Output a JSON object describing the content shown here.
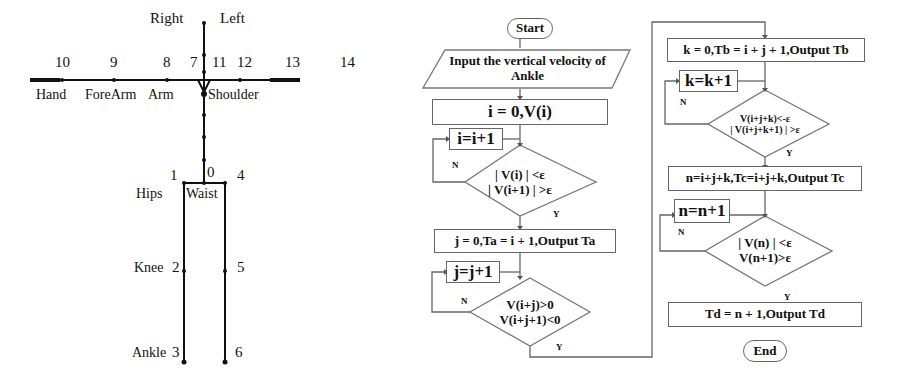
{
  "skeleton": {
    "direction_labels": {
      "right": "Right",
      "left": "Left"
    },
    "joint_numbers": {
      "j0": "0",
      "j1": "1",
      "j2": "2",
      "j3": "3",
      "j4": "4",
      "j5": "5",
      "j6": "6",
      "j7": "7",
      "j8": "8",
      "j9": "9",
      "j10": "10",
      "j11": "11",
      "j12": "12",
      "j13": "13",
      "j14": "14"
    },
    "part_labels": {
      "hand": "Hand",
      "forearm": "ForeArm",
      "arm": "Arm",
      "shoulder": "Shoulder",
      "hips": "Hips",
      "waist": "Waist",
      "knee": "Knee",
      "ankle": "Ankle"
    }
  },
  "flowchart": {
    "start": "Start",
    "input": "Input the vertical velocity of Ankle",
    "init_i": "i = 0,V(i)",
    "inc_i": "i=i+1",
    "cond_i_1": "| V(i) | <ε",
    "cond_i_2": "| V(i+1) | >ε",
    "out_ta": "j = 0,Ta = i + 1,Output Ta",
    "inc_j": "j=j+1",
    "cond_j_1": "V(i+j)>0",
    "cond_j_2": "V(i+j+1)<0",
    "out_tb": "k = 0,Tb = i + j + 1,Output Tb",
    "inc_k": "k=k+1",
    "cond_k_1": "V(i+j+k)<-ε",
    "cond_k_2": "| V(i+j+k+1) | >ε",
    "out_tc": "n=i+j+k,Tc=i+j+k,Output Tc",
    "inc_n": "n=n+1",
    "cond_n_1": "| V(n) | <ε",
    "cond_n_2": "V(n+1)>ε",
    "out_td": "Td = n + 1,Output Td",
    "end": "End",
    "yes": "Y",
    "no": "N"
  }
}
